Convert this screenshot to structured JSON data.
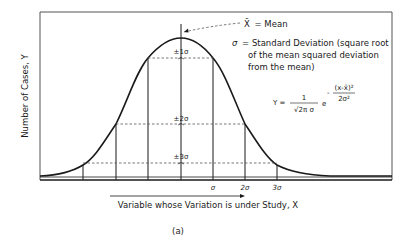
{
  "figure": {
    "caption": "(a)",
    "y_axis_label": "Number of Cases, Y",
    "x_axis_label": "Variable whose Variation is under Study, X",
    "legend": {
      "mean": {
        "symbol": "X̄",
        "text": "= Mean"
      },
      "sigma": {
        "symbol": "σ",
        "line1": "= Standard Deviation (square root",
        "line2": "of the mean squared deviation",
        "line3": "from the mean)"
      }
    },
    "formula": {
      "lhs": "Y =",
      "numerator": "1",
      "denominator": "√2π σ",
      "base": "e",
      "exp_sign": "-",
      "exp_numerator": "(x-x̄)²",
      "exp_denominator": "2σ²"
    },
    "band_labels": [
      "±1σ",
      "±2σ",
      "±3σ"
    ],
    "tick_labels": [
      "σ",
      "2σ",
      "3σ"
    ]
  },
  "colors": {
    "ink": "#1a1a1a",
    "paper": "#ffffff"
  }
}
